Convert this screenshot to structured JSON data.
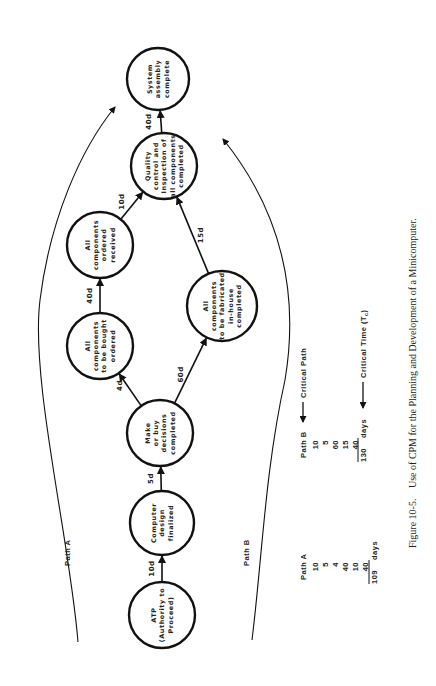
{
  "figure": {
    "caption_number": "Figure 10-5.",
    "caption_text": "Use of CPM for the Planning and Development of a Minicomputer."
  },
  "nodes": [
    {
      "id": "atp",
      "lines": [
        "ATP",
        "(Authority to",
        "Proceed)"
      ]
    },
    {
      "id": "design",
      "lines": [
        "Computer",
        "design",
        "finalized"
      ]
    },
    {
      "id": "makebuy",
      "lines": [
        "Make",
        "or buy",
        "decisions",
        "completed"
      ]
    },
    {
      "id": "bought",
      "lines": [
        "All",
        "components",
        "to be bought",
        "ordered"
      ]
    },
    {
      "id": "received",
      "lines": [
        "All",
        "components",
        "ordered",
        "received"
      ]
    },
    {
      "id": "fabricated",
      "lines": [
        "All",
        "components",
        "to be fabricated",
        "in-house",
        "completed"
      ]
    },
    {
      "id": "quality",
      "lines": [
        "Quality",
        "control and",
        "Inspection of",
        "all components",
        "completed"
      ]
    },
    {
      "id": "system",
      "lines": [
        "System",
        "assembly",
        "complete"
      ]
    }
  ],
  "edges": [
    {
      "from": "atp",
      "to": "design",
      "label": "10d"
    },
    {
      "from": "design",
      "to": "makebuy",
      "label": "5d"
    },
    {
      "from": "makebuy",
      "to": "bought",
      "label": "4d"
    },
    {
      "from": "bought",
      "to": "received",
      "label": "40d"
    },
    {
      "from": "received",
      "to": "quality",
      "label": "10d"
    },
    {
      "from": "makebuy",
      "to": "fabricated",
      "label": "60d"
    },
    {
      "from": "fabricated",
      "to": "quality",
      "label": "15d"
    },
    {
      "from": "quality",
      "to": "system",
      "label": "40d"
    }
  ],
  "paths": {
    "path_a_label": "Path A",
    "path_b_label": "Path B"
  },
  "summary": {
    "path_a": {
      "title": "Path A",
      "values": [
        "10",
        "5",
        "4",
        "40",
        "10",
        "40"
      ],
      "total": "109",
      "unit": "days"
    },
    "path_b": {
      "title": "Path B",
      "values": [
        "10",
        "5",
        "60",
        "15",
        "40"
      ],
      "total": "130",
      "unit": "days"
    },
    "critical_path_label": "Critical Path",
    "critical_time_label": "Critical Time (T",
    "critical_time_sub": "c",
    "critical_time_close": ")"
  }
}
